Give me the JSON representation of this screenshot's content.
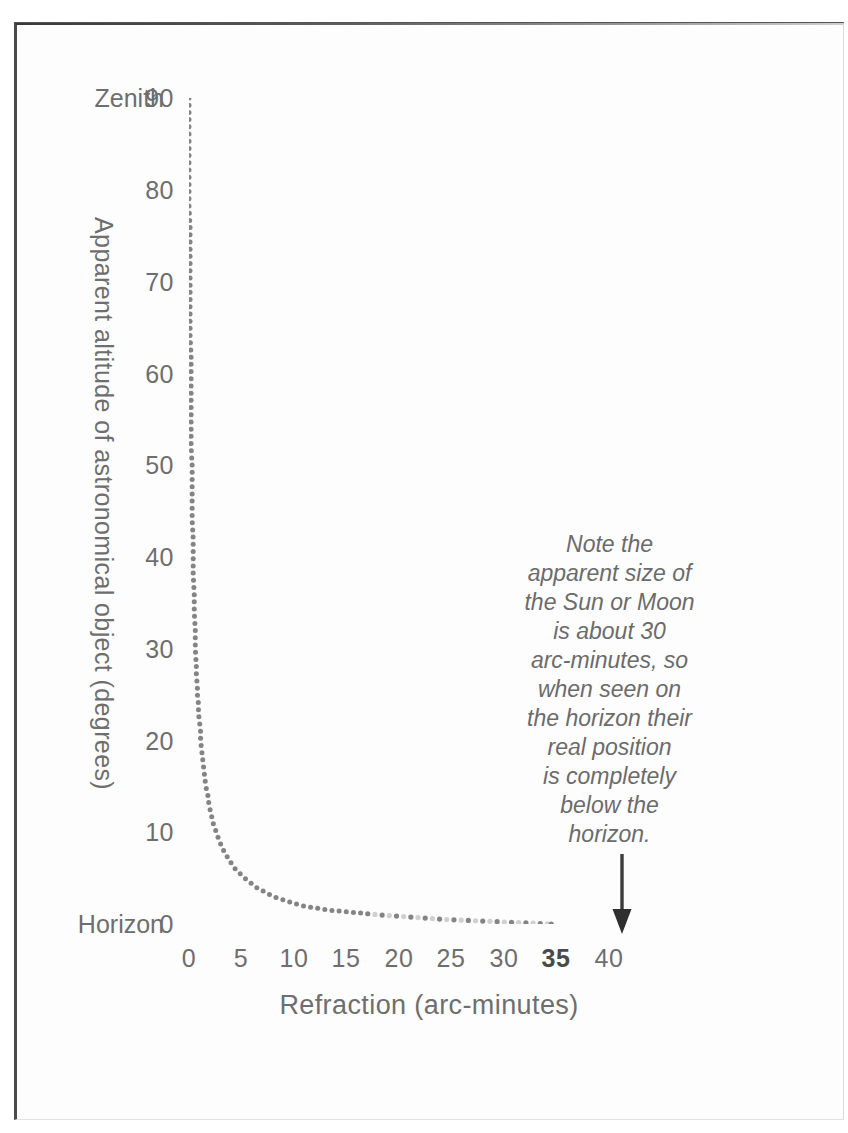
{
  "chart_data": {
    "type": "scatter",
    "title": "",
    "xlabel": "Refraction (arc-minutes)",
    "ylabel": "Apparent altitude of astronomical object (degrees)",
    "xlim": [
      0,
      40
    ],
    "ylim": [
      0,
      90
    ],
    "xticks": [
      "0",
      "5",
      "10",
      "15",
      "20",
      "25",
      "30",
      "35",
      "40"
    ],
    "xtick_values": [
      0,
      5,
      10,
      15,
      20,
      25,
      30,
      35,
      40
    ],
    "xtick_emphasis": "35",
    "yticks": [
      "0",
      "10",
      "20",
      "30",
      "40",
      "50",
      "60",
      "70",
      "80",
      "90"
    ],
    "ytick_values": [
      0,
      10,
      20,
      30,
      40,
      50,
      60,
      70,
      80,
      90
    ],
    "grid": false,
    "legend": null,
    "marker": "dot",
    "series": [
      {
        "name": "Atmospheric refraction",
        "x": [
          0.0,
          0.0,
          0.0,
          0.0,
          0.1,
          0.1,
          0.1,
          0.1,
          0.1,
          0.1,
          0.1,
          0.2,
          0.2,
          0.2,
          0.2,
          0.2,
          0.2,
          0.3,
          0.3,
          0.3,
          0.3,
          0.3,
          0.4,
          0.4,
          0.4,
          0.4,
          0.5,
          0.5,
          0.5,
          0.6,
          0.6,
          0.6,
          0.7,
          0.7,
          0.8,
          0.8,
          0.9,
          0.9,
          1.0,
          1.1,
          1.1,
          1.2,
          1.3,
          1.4,
          1.5,
          1.6,
          1.8,
          1.9,
          2.1,
          2.3,
          2.6,
          2.9,
          3.3,
          3.8,
          4.4,
          5.3,
          6.4,
          8.0,
          10.7,
          13.4,
          18.1,
          24.3,
          28.4,
          34.5
        ],
        "y": [
          90,
          85,
          80,
          78,
          76,
          74,
          72,
          70,
          68,
          66,
          64,
          62,
          60,
          58,
          56,
          54,
          52,
          50,
          48,
          46,
          45,
          44,
          42,
          41,
          40,
          38,
          36,
          35,
          34,
          32,
          31,
          30,
          28,
          27,
          26,
          25,
          24,
          23,
          22,
          21,
          20,
          19,
          18,
          17,
          16,
          15,
          14,
          13,
          12,
          11,
          10,
          9,
          8,
          7,
          6,
          5,
          4,
          3,
          2,
          1.5,
          1,
          0.5,
          0.3,
          0.0
        ]
      }
    ],
    "axis_endpoint_labels": {
      "top": "Zenith",
      "bottom": "Horizon"
    },
    "annotation": {
      "arrow_at_x": 35,
      "lines": [
        "Note the",
        "apparent size of",
        "the Sun or Moon",
        "is about 30",
        "arc-minutes, so",
        "when seen on",
        "the horizon their",
        "real position",
        "is completely",
        "below the",
        "horizon."
      ]
    }
  },
  "colors": {
    "text": "#6e6e6e",
    "marker": "#7a7a7a",
    "frame": "#4a4a4a",
    "arrow": "#3b3b3b"
  }
}
